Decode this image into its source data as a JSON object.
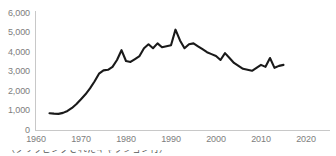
{
  "chart_data": {
    "type": "line",
    "title": "",
    "subtitle": "",
    "xlabel": "",
    "ylabel": "",
    "xlim": [
      1960,
      2020
    ],
    "ylim": [
      0,
      6000
    ],
    "grid": false,
    "legend": null,
    "y_ticks": [
      0,
      1000,
      2000,
      3000,
      4000,
      5000,
      6000
    ],
    "y_tick_labels": [
      "0",
      "1,000",
      "2,000",
      "3,000",
      "4,000",
      "5,000",
      "6,000"
    ],
    "x_ticks": [
      1960,
      1970,
      1980,
      1990,
      2000,
      2010,
      2020
    ],
    "x_tick_labels": [
      "1960",
      "1970",
      "1980",
      "1990",
      "2000",
      "2010",
      "2020"
    ],
    "series": [
      {
        "name": "series-1",
        "color": "#1a1a1a",
        "x": [
          1963,
          1964,
          1965,
          1966,
          1967,
          1968,
          1969,
          1970,
          1971,
          1972,
          1973,
          1974,
          1975,
          1976,
          1977,
          1978,
          1979,
          1980,
          1981,
          1982,
          1983,
          1984,
          1985,
          1986,
          1987,
          1988,
          1989,
          1990,
          1991,
          1992,
          1993,
          1994,
          1995,
          1996,
          1997,
          1998,
          1999,
          2000,
          2001,
          2002,
          2003,
          2004,
          2005,
          2006,
          2007,
          2008,
          2009,
          2010,
          2011,
          2012,
          2013,
          2014,
          2015
        ],
        "values": [
          880,
          860,
          850,
          900,
          1000,
          1150,
          1350,
          1600,
          1850,
          2150,
          2500,
          2900,
          3070,
          3100,
          3250,
          3600,
          4100,
          3550,
          3500,
          3650,
          3800,
          4200,
          4400,
          4200,
          4450,
          4250,
          4300,
          4350,
          5150,
          4600,
          4200,
          4400,
          4450,
          4300,
          4150,
          4000,
          3900,
          3800,
          3600,
          3950,
          3700,
          3450,
          3300,
          3150,
          3100,
          3050,
          3200,
          3350,
          3250,
          3700,
          3200,
          3300,
          3350
        ]
      }
    ]
  },
  "axis": {
    "y_axis_color": "#c8c8c8",
    "x_axis_color": "#c8c8c8",
    "tick_text_color": "#7d7d7d"
  },
  "caption": {
    "text": "（クリッピングされたキャプション行）"
  }
}
